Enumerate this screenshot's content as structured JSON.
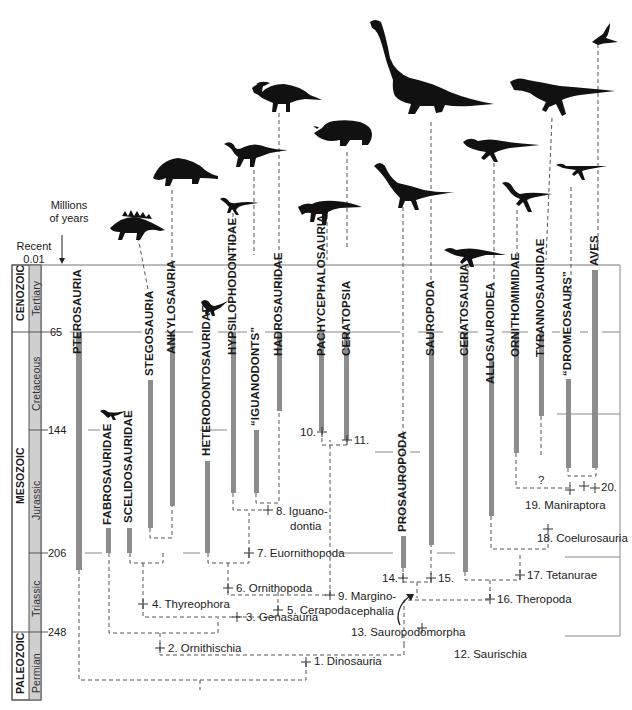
{
  "axis": {
    "title_line1": "Millions",
    "title_line2": "of years",
    "recent_label": "Recent",
    "recent_value": "0.01",
    "ticks": [
      {
        "label": "65",
        "y": 332
      },
      {
        "label": "144",
        "y": 430
      },
      {
        "label": "206",
        "y": 553
      },
      {
        "label": "248",
        "y": 632
      }
    ]
  },
  "timescale": {
    "eras": [
      {
        "name": "CENOZOIC",
        "top": 265,
        "bottom": 332
      },
      {
        "name": "MESOZOIC",
        "top": 332,
        "bottom": 632
      },
      {
        "name": "PALEOZOIC",
        "top": 632,
        "bottom": 700
      }
    ],
    "periods": [
      {
        "name": "Tertiary",
        "top": 265,
        "bottom": 332
      },
      {
        "name": "Cretaceous",
        "top": 332,
        "bottom": 430
      },
      {
        "name": "Jurassic",
        "top": 430,
        "bottom": 553
      },
      {
        "name": "Triassic",
        "top": 553,
        "bottom": 632
      },
      {
        "name": "Permian",
        "top": 632,
        "bottom": 700
      }
    ],
    "fill_color": "#cfcfcf"
  },
  "taxa": [
    {
      "name": "PTEROSAURIA",
      "x": 79,
      "bar_top": 332,
      "bar_bottom": 570
    },
    {
      "name": "FABROSAURIDAE",
      "x": 109,
      "bar_top": 528,
      "bar_bottom": 553
    },
    {
      "name": "SCELIDOSAURIDAE",
      "x": 130,
      "bar_top": 528,
      "bar_bottom": 553
    },
    {
      "name": "STEGOSAURIA",
      "x": 150,
      "bar_top": 380,
      "bar_bottom": 528
    },
    {
      "name": "ANKYLOSAURIA",
      "x": 172,
      "bar_top": 332,
      "bar_bottom": 506
    },
    {
      "name": "HETERODONTOSAURIDAE",
      "x": 208,
      "bar_top": 461,
      "bar_bottom": 553
    },
    {
      "name": "HYPSILOPHODONTIDAE",
      "x": 233,
      "bar_top": 332,
      "bar_bottom": 493
    },
    {
      "name": "“IGUANODONTS”",
      "x": 256,
      "bar_top": 430,
      "bar_bottom": 493
    },
    {
      "name": "HADROSAURIDAE",
      "x": 279,
      "bar_top": 332,
      "bar_bottom": 411
    },
    {
      "name": "PACHYCEPHALOSAURIA",
      "x": 322,
      "bar_top": 332,
      "bar_bottom": 431
    },
    {
      "name": "CERATOPSIA",
      "x": 347,
      "bar_top": 332,
      "bar_bottom": 440
    },
    {
      "name": "PROSAUROPODA",
      "x": 403,
      "bar_top": 536,
      "bar_bottom": 568
    },
    {
      "name": "SAUROPODA",
      "x": 431,
      "bar_top": 332,
      "bar_bottom": 545
    },
    {
      "name": "CERATOSAURIA",
      "x": 465,
      "bar_top": 332,
      "bar_bottom": 572
    },
    {
      "name": "ALLOSAUROIDEA",
      "x": 491,
      "bar_top": 358,
      "bar_bottom": 516
    },
    {
      "name": "ORNITHOMIMIDAE",
      "x": 516,
      "bar_top": 332,
      "bar_bottom": 453
    },
    {
      "name": "TYRANNOSAURIDAE",
      "x": 541,
      "bar_top": 332,
      "bar_bottom": 416
    },
    {
      "name": "“DROMEOSAURS”",
      "x": 568,
      "bar_top": 379,
      "bar_bottom": 468
    },
    {
      "name": "AVES",
      "x": 595,
      "bar_top": 270,
      "bar_bottom": 468
    }
  ],
  "clades": [
    {
      "id": "1",
      "label": "1. Dinosauria"
    },
    {
      "id": "2",
      "label": "2. Ornithischia"
    },
    {
      "id": "3",
      "label": "3. Genasauria"
    },
    {
      "id": "4",
      "label": "4. Thyreophora"
    },
    {
      "id": "5",
      "label": "5. Cerapoda"
    },
    {
      "id": "6",
      "label": "6. Ornithopoda"
    },
    {
      "id": "7",
      "label": "7. Euornithopoda"
    },
    {
      "id": "8",
      "label": "8. Iguano-",
      "label2": "dontia"
    },
    {
      "id": "9",
      "label": "9. Margino-",
      "label2": "cephalia"
    },
    {
      "id": "10",
      "label": "10."
    },
    {
      "id": "11",
      "label": "11."
    },
    {
      "id": "12",
      "label": "12. Saurischia"
    },
    {
      "id": "13",
      "label": "13. Sauropodomorpha"
    },
    {
      "id": "14",
      "label": "14."
    },
    {
      "id": "15",
      "label": "15."
    },
    {
      "id": "16",
      "label": "16. Theropoda"
    },
    {
      "id": "17",
      "label": "17. Tetanurae"
    },
    {
      "id": "18",
      "label": "18. Coelurosauria"
    },
    {
      "id": "19",
      "label": "19. Maniraptora"
    },
    {
      "id": "20",
      "label": "20."
    }
  ],
  "uncertain_mark": "?",
  "silhouettes": [
    {
      "name": "stegosaur-icon"
    },
    {
      "name": "ankylosaur-icon"
    },
    {
      "name": "small-ornithopod-icon"
    },
    {
      "name": "hypsilophodont-icon"
    },
    {
      "name": "iguanodont-icon"
    },
    {
      "name": "hadrosaur-icon"
    },
    {
      "name": "pachycephalosaur-icon"
    },
    {
      "name": "ceratopsian-icon"
    },
    {
      "name": "prosauropod-icon"
    },
    {
      "name": "sauropod-icon"
    },
    {
      "name": "ceratosaur-icon"
    },
    {
      "name": "allosaur-icon"
    },
    {
      "name": "ornithomimid-icon"
    },
    {
      "name": "tyrannosaur-icon"
    },
    {
      "name": "dromaeosaur-icon"
    },
    {
      "name": "bird-icon"
    },
    {
      "name": "fabrosaur-icon"
    },
    {
      "name": "heterodontosaur-icon"
    }
  ],
  "colors": {
    "bar": "#8c8c8c",
    "line": "#555555",
    "silhouette": "#111111",
    "boundary": "#777777"
  }
}
